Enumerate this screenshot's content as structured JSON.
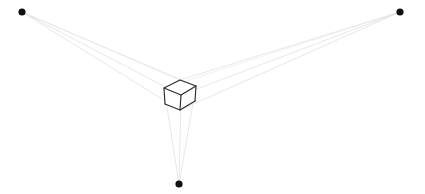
{
  "figure": {
    "background_color": "#ffffff",
    "width": 425,
    "height": 194
  },
  "chart_data": {
    "type": "diagram",
    "xlabel": "",
    "ylabel": "",
    "xlim": [
      0,
      425
    ],
    "ylim": [
      0,
      194
    ],
    "grid": false,
    "legend": "none",
    "colors": {
      "background": "#ffffff",
      "vanishing_point": "#111111",
      "guide_line": "#dcdcdc",
      "guide_line_faint": "#e6e6e6",
      "cube_edge": "#2b2b2b"
    },
    "vanishing_points": [
      {
        "name": "left-vanishing-point",
        "x": 22,
        "y": 12,
        "radius": 3.6
      },
      {
        "name": "right-vanishing-point",
        "x": 400,
        "y": 12,
        "radius": 3.6
      },
      {
        "name": "bottom-vanishing-point",
        "x": 179,
        "y": 184,
        "radius": 3.6
      }
    ],
    "cube_vertices": {
      "top_back": {
        "x": 180,
        "y": 80
      },
      "top_left": {
        "x": 164,
        "y": 88
      },
      "top_front": {
        "x": 181,
        "y": 95
      },
      "top_right": {
        "x": 196,
        "y": 86
      },
      "bottom_left": {
        "x": 165,
        "y": 104
      },
      "bottom_front": {
        "x": 180,
        "y": 110
      },
      "bottom_right": {
        "x": 195,
        "y": 101
      }
    },
    "cube_edges": [
      [
        "top_back",
        "top_left"
      ],
      [
        "top_left",
        "top_front"
      ],
      [
        "top_front",
        "top_right"
      ],
      [
        "top_right",
        "top_back"
      ],
      [
        "top_left",
        "bottom_left"
      ],
      [
        "top_front",
        "bottom_front"
      ],
      [
        "top_right",
        "bottom_right"
      ],
      [
        "bottom_left",
        "bottom_front"
      ],
      [
        "bottom_front",
        "bottom_right"
      ]
    ],
    "guide_lines": [
      {
        "from": "left-vanishing-point",
        "to_x": 180,
        "to_y": 80,
        "label": "lvp-to-top-back"
      },
      {
        "from": "left-vanishing-point",
        "to_x": 181,
        "to_y": 95,
        "label": "lvp-to-top-front"
      },
      {
        "from": "left-vanishing-point",
        "to_x": 180,
        "to_y": 110,
        "label": "lvp-to-bottom-front"
      },
      {
        "from": "left-vanishing-point",
        "to_x": 196,
        "to_y": 86,
        "label": "lvp-to-top-right"
      },
      {
        "from": "right-vanishing-point",
        "to_x": 180,
        "to_y": 80,
        "label": "rvp-to-top-back"
      },
      {
        "from": "right-vanishing-point",
        "to_x": 181,
        "to_y": 95,
        "label": "rvp-to-top-front"
      },
      {
        "from": "right-vanishing-point",
        "to_x": 180,
        "to_y": 110,
        "label": "rvp-to-bottom-front"
      },
      {
        "from": "right-vanishing-point",
        "to_x": 164,
        "to_y": 88,
        "label": "rvp-to-top-left"
      },
      {
        "from": "bottom-vanishing-point",
        "to_x": 164,
        "to_y": 88,
        "label": "bvp-to-top-left"
      },
      {
        "from": "bottom-vanishing-point",
        "to_x": 181,
        "to_y": 95,
        "label": "bvp-to-top-front"
      },
      {
        "from": "bottom-vanishing-point",
        "to_x": 196,
        "to_y": 86,
        "label": "bvp-to-top-right"
      }
    ]
  }
}
